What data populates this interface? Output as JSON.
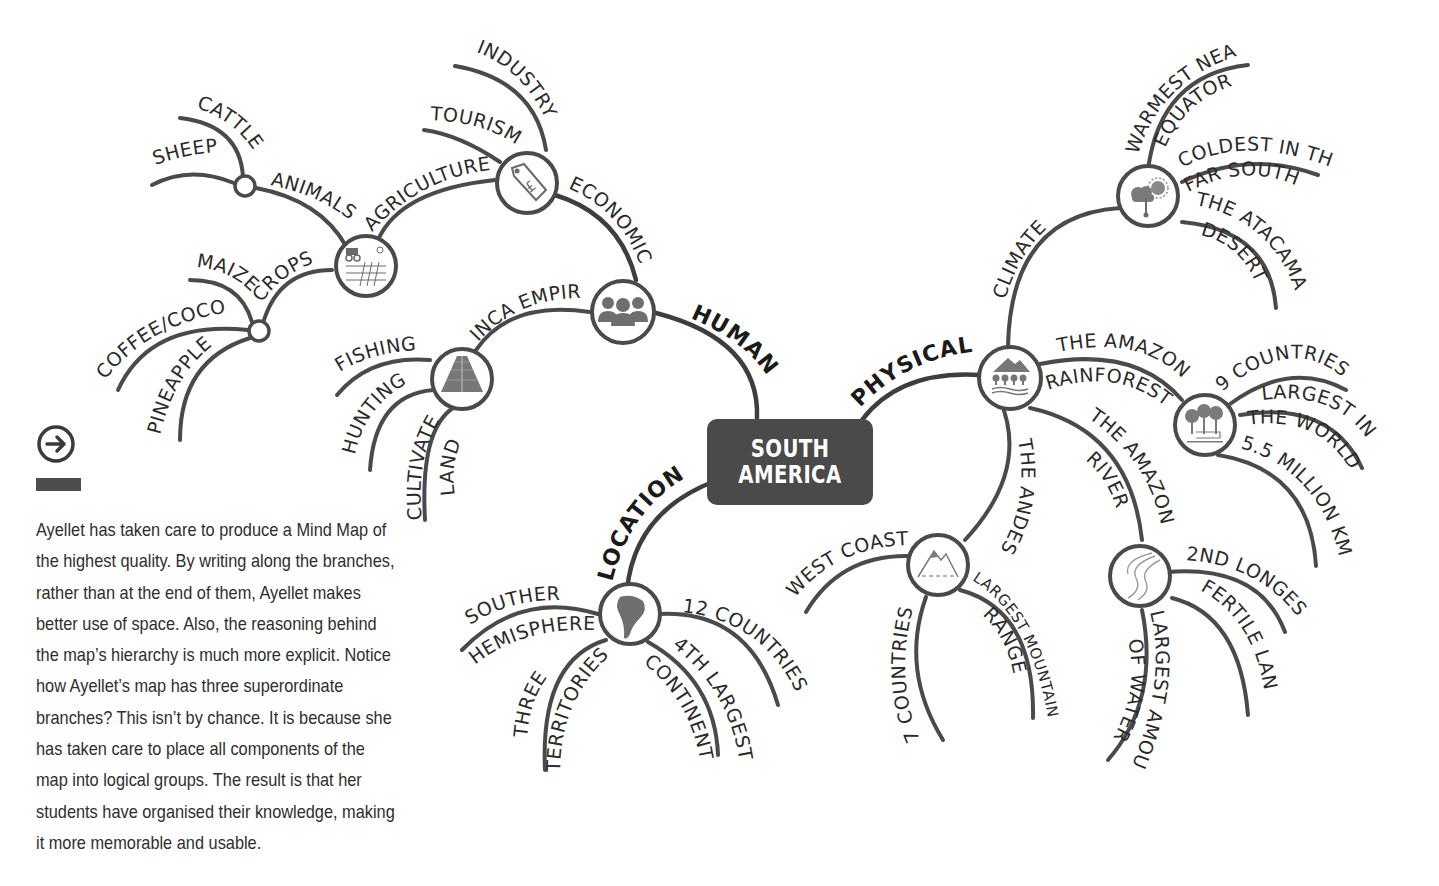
{
  "center": {
    "line1": "SOUTH",
    "line2": "AMERICA",
    "color": "#4a4a4a"
  },
  "main_branches": {
    "human": "HUMAN",
    "location": "LOCATION",
    "physical": "PHYSICAL"
  },
  "human": {
    "economic": {
      "label": "ECONOMIC",
      "icon": "price-tag-pound-icon",
      "children": {
        "industry": "INDUSTRY",
        "tourism": "TOURISM",
        "agriculture": "AGRICULTURE"
      }
    },
    "agriculture": {
      "icon": "farming-icon",
      "animals": {
        "label": "ANIMALS",
        "children": {
          "cattle": "CATTLE",
          "sheep": "SHEEP"
        }
      },
      "crops": {
        "label": "CROPS",
        "children": {
          "maize": "MAIZE",
          "coffee": "COFFEE/COCOA",
          "pineapple": "PINEAPPLE"
        }
      }
    },
    "inca": {
      "label": "INCA EMPIRE",
      "icon": "pyramid-icon",
      "children": {
        "fishing": "FISHING",
        "hunting": "HUNTING",
        "cultivate_1": "CULTIVATE",
        "cultivate_2": "LAND"
      }
    },
    "icon": "people-group-icon"
  },
  "location": {
    "icon": "south-america-map-icon",
    "children": {
      "southern": "SOUTHERN",
      "hemisphere": "HEMISPHERE",
      "three": "THREE",
      "territories": "TERRITORIES",
      "continent": "CONTINENT",
      "fourth_largest": "4TH LARGEST",
      "countries": "12 COUNTRIES"
    }
  },
  "physical": {
    "icon": "landscape-icon",
    "climate": {
      "label": "CLIMATE",
      "icon": "weather-icon",
      "children": {
        "warmest_1": "WARMEST NEAR",
        "warmest_2": "EQUATOR",
        "coldest_1": "COLDEST IN THE",
        "coldest_2": "FAR SOUTH",
        "atacama_1": "THE ATACAMA",
        "atacama_2": "DESERT"
      }
    },
    "rainforest": {
      "label_1": "THE AMAZON",
      "label_2": "RAINFOREST",
      "icon": "forest-icon",
      "children": {
        "countries": "9 COUNTRIES",
        "largest_1": "LARGEST IN",
        "largest_2": "THE WORLD",
        "size": "5.5 MILLION KM"
      }
    },
    "andes": {
      "label": "THE ANDES",
      "icon": "mountain-icon",
      "children": {
        "west_coast": "WEST COAST",
        "countries": "7 COUNTRIES",
        "range_1": "LARGEST MOUNTAIN",
        "range_2": "RANGE"
      }
    },
    "river": {
      "label_1": "THE AMAZON",
      "label_2": "RIVER",
      "icon": "river-icon",
      "children": {
        "longest": "2ND LONGEST",
        "fertile": "FERTILE LAND",
        "water_1": "LARGEST AMOUNT",
        "water_2": "OF WATER"
      }
    }
  },
  "sidebar": {
    "arrow_icon": "arrow-right-circle-icon",
    "caption": "Ayellet has taken care to produce a Mind Map of the highest quality. By writing along the branches, rather than at the end of them, Ayellet makes better use of space. Also, the reasoning behind the map’s hierarchy is much more explicit. Notice how Ayellet’s map has three superordinate branches? This isn’t by chance. It is because she has taken care to place all components of the map into logical groups. The result is that her students have organised their knowledge, making it more memorable and usable."
  }
}
